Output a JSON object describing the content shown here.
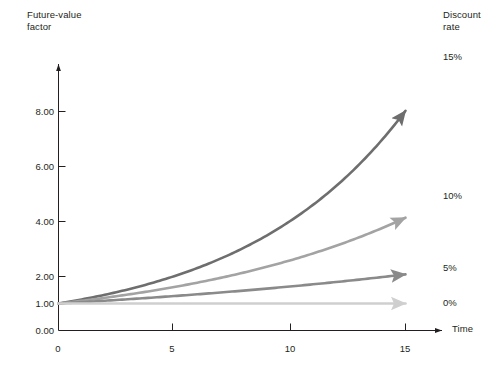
{
  "chart_data": {
    "type": "line",
    "title": "",
    "ylabel": "Future-value\nfactor",
    "xlabel": "Time",
    "legend_title": "Discount\nrate",
    "legend_position": "right",
    "grid": false,
    "xlim": [
      0,
      17
    ],
    "ylim": [
      0,
      9
    ],
    "x_ticks": [
      0,
      5,
      10,
      15
    ],
    "x_tick_labels": [
      "0",
      "5",
      "10",
      "15"
    ],
    "y_ticks": [
      0,
      1,
      2,
      4,
      6,
      8
    ],
    "y_tick_labels": [
      "0.00",
      "1.00",
      "2.00",
      "4.00",
      "6.00",
      "8.00"
    ],
    "x": [
      0,
      1,
      2,
      3,
      4,
      5,
      6,
      7,
      8,
      9,
      10,
      11,
      12,
      13,
      14,
      15
    ],
    "series": [
      {
        "name": "15%",
        "rate": 0.15,
        "color": "#6e6e6e",
        "values": [
          1.0,
          1.15,
          1.32,
          1.52,
          1.75,
          2.01,
          2.31,
          2.66,
          3.06,
          3.52,
          4.05,
          4.65,
          5.35,
          6.15,
          7.08,
          8.14
        ]
      },
      {
        "name": "10%",
        "rate": 0.1,
        "color": "#a3a3a3",
        "values": [
          1.0,
          1.1,
          1.21,
          1.33,
          1.46,
          1.61,
          1.77,
          1.95,
          2.14,
          2.36,
          2.59,
          2.85,
          3.14,
          3.45,
          3.8,
          4.18
        ]
      },
      {
        "name": "5%",
        "rate": 0.05,
        "color": "#8a8a8a",
        "values": [
          1.0,
          1.05,
          1.1,
          1.16,
          1.22,
          1.28,
          1.34,
          1.41,
          1.48,
          1.55,
          1.63,
          1.71,
          1.8,
          1.89,
          1.98,
          2.08
        ]
      },
      {
        "name": "0%",
        "rate": 0.0,
        "color": "#cfcfcf",
        "values": [
          1.0,
          1.0,
          1.0,
          1.0,
          1.0,
          1.0,
          1.0,
          1.0,
          1.0,
          1.0,
          1.0,
          1.0,
          1.0,
          1.0,
          1.0,
          1.0
        ]
      }
    ]
  },
  "labels": {
    "y_axis_title": "Future-value\nfactor",
    "x_axis_title": "Time",
    "legend_header": "Discount\nrate"
  },
  "y_tick_labels": {
    "t0": "0.00",
    "t1": "1.00",
    "t2": "2.00",
    "t4": "4.00",
    "t6": "6.00",
    "t8": "8.00"
  },
  "x_tick_labels": {
    "t0": "0",
    "t5": "5",
    "t10": "10",
    "t15": "15"
  },
  "legend_items": {
    "i0": "15%",
    "i1": "10%",
    "i2": "5%",
    "i3": "0%"
  },
  "colors": {
    "series_15": "#6e6e6e",
    "series_10": "#a3a3a3",
    "series_5": "#8a8a8a",
    "series_0": "#cfcfcf",
    "axis": "#231f20",
    "background": "#ffffff"
  }
}
